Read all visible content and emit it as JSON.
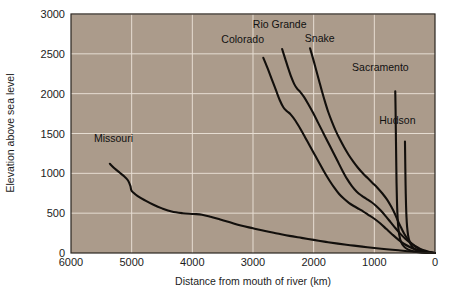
{
  "chart_data": {
    "type": "line",
    "title": "",
    "xlabel": "Distance from mouth of river (km)",
    "ylabel": "Elevation above sea level",
    "xlim": [
      6000,
      0
    ],
    "ylim": [
      0,
      3000
    ],
    "x_reversed": true,
    "grid": true,
    "legend_position": "inline-labels",
    "xticks": [
      6000,
      5000,
      4000,
      3000,
      2000,
      1000,
      0
    ],
    "xtick_labels": [
      "6000",
      "5000",
      "4000",
      "3000",
      "2000",
      "1000",
      "0"
    ],
    "yticks": [
      0,
      500,
      1000,
      1500,
      2000,
      2500,
      3000
    ],
    "ytick_labels": [
      "0",
      "500",
      "1000",
      "1500",
      "2000",
      "2500",
      "3000"
    ],
    "series": [
      {
        "name": "Missouri",
        "label": "Missouri",
        "points": [
          [
            5360,
            1120
          ],
          [
            5280,
            1060
          ],
          [
            5200,
            1010
          ],
          [
            5120,
            960
          ],
          [
            5060,
            910
          ],
          [
            5020,
            840
          ],
          [
            5000,
            780
          ],
          [
            4900,
            715
          ],
          [
            4780,
            660
          ],
          [
            4640,
            605
          ],
          [
            4500,
            560
          ],
          [
            4340,
            520
          ],
          [
            4160,
            500
          ],
          [
            3980,
            490
          ],
          [
            3840,
            480
          ],
          [
            3700,
            455
          ],
          [
            3540,
            420
          ],
          [
            3380,
            385
          ],
          [
            3200,
            345
          ],
          [
            3000,
            310
          ],
          [
            2800,
            275
          ],
          [
            2600,
            245
          ],
          [
            2400,
            215
          ],
          [
            2200,
            190
          ],
          [
            2000,
            165
          ],
          [
            1800,
            140
          ],
          [
            1600,
            118
          ],
          [
            1400,
            98
          ],
          [
            1200,
            80
          ],
          [
            1000,
            63
          ],
          [
            800,
            48
          ],
          [
            600,
            34
          ],
          [
            400,
            20
          ],
          [
            200,
            10
          ],
          [
            0,
            0
          ]
        ]
      },
      {
        "name": "Colorado",
        "label": "Colorado",
        "points": [
          [
            2830,
            2450
          ],
          [
            2760,
            2320
          ],
          [
            2690,
            2180
          ],
          [
            2620,
            2040
          ],
          [
            2560,
            1920
          ],
          [
            2500,
            1830
          ],
          [
            2440,
            1780
          ],
          [
            2380,
            1740
          ],
          [
            2300,
            1660
          ],
          [
            2220,
            1560
          ],
          [
            2140,
            1450
          ],
          [
            2060,
            1340
          ],
          [
            1980,
            1230
          ],
          [
            1900,
            1120
          ],
          [
            1820,
            1010
          ],
          [
            1740,
            910
          ],
          [
            1660,
            820
          ],
          [
            1580,
            740
          ],
          [
            1500,
            680
          ],
          [
            1420,
            630
          ],
          [
            1340,
            590
          ],
          [
            1260,
            555
          ],
          [
            1180,
            520
          ],
          [
            1100,
            480
          ],
          [
            1000,
            430
          ],
          [
            900,
            370
          ],
          [
            800,
            300
          ],
          [
            700,
            230
          ],
          [
            600,
            165
          ],
          [
            500,
            110
          ],
          [
            400,
            70
          ],
          [
            300,
            42
          ],
          [
            200,
            22
          ],
          [
            100,
            9
          ],
          [
            0,
            0
          ]
        ]
      },
      {
        "name": "Rio Grande",
        "label": "Rio Grande",
        "points": [
          [
            2520,
            2560
          ],
          [
            2470,
            2440
          ],
          [
            2420,
            2320
          ],
          [
            2370,
            2210
          ],
          [
            2320,
            2120
          ],
          [
            2270,
            2060
          ],
          [
            2220,
            2020
          ],
          [
            2160,
            1960
          ],
          [
            2090,
            1870
          ],
          [
            2010,
            1760
          ],
          [
            1930,
            1640
          ],
          [
            1850,
            1520
          ],
          [
            1770,
            1400
          ],
          [
            1690,
            1280
          ],
          [
            1610,
            1160
          ],
          [
            1530,
            1040
          ],
          [
            1450,
            930
          ],
          [
            1370,
            840
          ],
          [
            1290,
            770
          ],
          [
            1210,
            720
          ],
          [
            1130,
            680
          ],
          [
            1050,
            640
          ],
          [
            970,
            590
          ],
          [
            890,
            530
          ],
          [
            810,
            460
          ],
          [
            730,
            385
          ],
          [
            650,
            310
          ],
          [
            570,
            240
          ],
          [
            490,
            180
          ],
          [
            410,
            130
          ],
          [
            330,
            88
          ],
          [
            250,
            55
          ],
          [
            170,
            30
          ],
          [
            90,
            12
          ],
          [
            0,
            0
          ]
        ]
      },
      {
        "name": "Snake",
        "label": "Snake",
        "points": [
          [
            2060,
            2570
          ],
          [
            2010,
            2440
          ],
          [
            1960,
            2300
          ],
          [
            1910,
            2160
          ],
          [
            1860,
            2020
          ],
          [
            1810,
            1890
          ],
          [
            1760,
            1770
          ],
          [
            1700,
            1650
          ],
          [
            1640,
            1540
          ],
          [
            1570,
            1430
          ],
          [
            1500,
            1330
          ],
          [
            1430,
            1240
          ],
          [
            1350,
            1150
          ],
          [
            1270,
            1070
          ],
          [
            1190,
            1000
          ],
          [
            1110,
            940
          ],
          [
            1030,
            880
          ],
          [
            950,
            820
          ],
          [
            870,
            750
          ],
          [
            790,
            670
          ],
          [
            720,
            580
          ],
          [
            660,
            490
          ],
          [
            610,
            400
          ],
          [
            560,
            320
          ],
          [
            510,
            245
          ],
          [
            450,
            175
          ],
          [
            380,
            115
          ],
          [
            300,
            68
          ],
          [
            220,
            35
          ],
          [
            140,
            15
          ],
          [
            60,
            4
          ],
          [
            0,
            0
          ]
        ]
      },
      {
        "name": "Sacramento",
        "label": "Sacramento",
        "points": [
          [
            655,
            2030
          ],
          [
            650,
            1800
          ],
          [
            646,
            1560
          ],
          [
            642,
            1330
          ],
          [
            638,
            1100
          ],
          [
            634,
            880
          ],
          [
            628,
            680
          ],
          [
            620,
            500
          ],
          [
            608,
            350
          ],
          [
            590,
            230
          ],
          [
            560,
            140
          ],
          [
            510,
            80
          ],
          [
            440,
            42
          ],
          [
            350,
            20
          ],
          [
            250,
            8
          ],
          [
            140,
            2
          ],
          [
            0,
            0
          ]
        ]
      },
      {
        "name": "Hudson",
        "label": "Hudson",
        "points": [
          [
            495,
            1400
          ],
          [
            492,
            1230
          ],
          [
            489,
            1060
          ],
          [
            486,
            900
          ],
          [
            482,
            740
          ],
          [
            477,
            590
          ],
          [
            470,
            450
          ],
          [
            460,
            330
          ],
          [
            444,
            225
          ],
          [
            420,
            145
          ],
          [
            385,
            88
          ],
          [
            335,
            48
          ],
          [
            270,
            22
          ],
          [
            190,
            8
          ],
          [
            100,
            2
          ],
          [
            0,
            0
          ]
        ]
      }
    ],
    "annotations": [
      {
        "text": "Missouri",
        "x": 5300,
        "y": 1390
      },
      {
        "text": "Colorado",
        "x": 3170,
        "y": 2640
      },
      {
        "text": "Rio Grande",
        "x": 2560,
        "y": 2830
      },
      {
        "text": "Snake",
        "x": 1900,
        "y": 2650
      },
      {
        "text": "Sacramento",
        "x": 900,
        "y": 2280
      },
      {
        "text": "Hudson",
        "x": 620,
        "y": 1620
      }
    ],
    "colors": {
      "plot_background": "#ab9b8b",
      "gridline": "#e6ddd2",
      "line": "#120f0c",
      "text": "#1c1c1c",
      "page_background": "#ffffff"
    }
  }
}
